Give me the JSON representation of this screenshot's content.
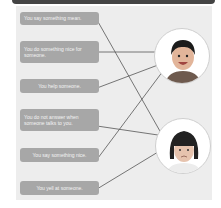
{
  "activity": {
    "statements": [
      {
        "id": 1,
        "text": "You say something mean."
      },
      {
        "id": 2,
        "text": "You do something nice for someone."
      },
      {
        "id": 3,
        "text": "You help someone."
      },
      {
        "id": 4,
        "text": "You do not answer when someone talks to you."
      },
      {
        "id": 5,
        "text": "You say something nice."
      },
      {
        "id": 6,
        "text": "You yell at someone."
      }
    ],
    "pictures": [
      {
        "id": "boy",
        "label": "happy-boy-photo"
      },
      {
        "id": "girl",
        "label": "sad-girl-photo"
      }
    ],
    "matches": [
      {
        "statement": 1,
        "picture": "girl"
      },
      {
        "statement": 2,
        "picture": "boy"
      },
      {
        "statement": 3,
        "picture": "boy"
      },
      {
        "statement": 4,
        "picture": "girl"
      },
      {
        "statement": 5,
        "picture": "boy"
      },
      {
        "statement": 6,
        "picture": "girl"
      }
    ]
  }
}
